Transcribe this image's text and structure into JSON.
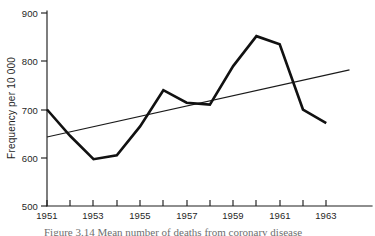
{
  "figure": {
    "background_color": "#ffffff",
    "ink_color": "#111111",
    "caption_partial": "Figure 3.14   Mean number of deaths from coronary disease"
  },
  "chart_data": {
    "type": "line",
    "title": "",
    "subtitle": "",
    "xlabel": "",
    "ylabel": "Frequency per 10 000",
    "x": [
      1951,
      1952,
      1953,
      1954,
      1955,
      1956,
      1957,
      1958,
      1959,
      1960,
      1961,
      1962,
      1963
    ],
    "xlim": [
      1951,
      1964
    ],
    "ylim": [
      500,
      900
    ],
    "grid": false,
    "legend_position": "none",
    "y_ticks": [
      500,
      600,
      700,
      800,
      900
    ],
    "y_tick_labels": [
      "500",
      "600",
      "700",
      "800",
      "900"
    ],
    "x_ticks": [
      1951,
      1952,
      1953,
      1954,
      1955,
      1956,
      1957,
      1958,
      1959,
      1960,
      1961,
      1962,
      1963
    ],
    "x_tick_labels_shown": [
      "1951",
      "",
      "1953",
      "",
      "1955",
      "",
      "1957",
      "",
      "1959",
      "",
      "1961",
      "",
      "1963"
    ],
    "x_labelled_ticks": [
      "1951",
      "1953",
      "1955",
      "1957",
      "1959",
      "1961",
      "1963"
    ],
    "series": [
      {
        "name": "Frequency",
        "style": "thick-solid",
        "color": "#111111",
        "values": [
          700,
          645,
          597,
          605,
          665,
          740,
          714,
          710,
          790,
          852,
          835,
          700,
          672
        ]
      },
      {
        "name": "Linear trend",
        "style": "thin-solid",
        "color": "#1a1a1a",
        "x": [
          1951,
          1964
        ],
        "values": [
          643,
          782
        ]
      }
    ],
    "annotations": []
  },
  "axes": {
    "y_axis_name": "y-axis",
    "x_axis_name": "x-axis",
    "y_title": "Frequency per 10 000"
  }
}
